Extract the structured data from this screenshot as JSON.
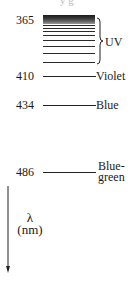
{
  "diagram": {
    "type": "spectral-line-series",
    "top_fragment": "y   g",
    "uv_region": {
      "label": "UV",
      "start_wavelength": "365"
    },
    "lines": [
      {
        "wavelength": "365",
        "name": ""
      },
      {
        "wavelength": "410",
        "name": "Violet"
      },
      {
        "wavelength": "434",
        "name": "Blue"
      },
      {
        "wavelength": "486",
        "name_line1": "Blue-",
        "name_line2": "green"
      }
    ],
    "axis": {
      "symbol": "λ",
      "unit": "(nm)",
      "direction": "down"
    },
    "colors": {
      "line": "#222222",
      "text": "#1a1a1a"
    }
  }
}
